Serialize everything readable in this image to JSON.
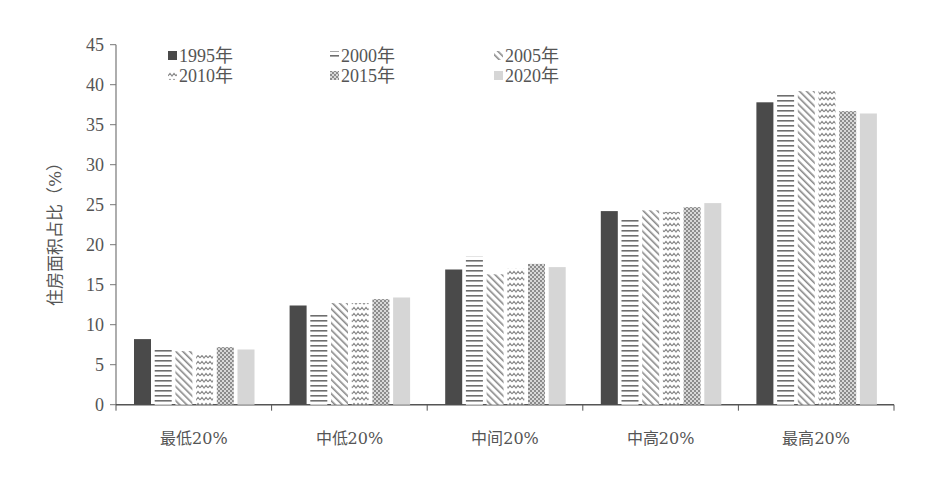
{
  "chart_data": {
    "type": "bar",
    "title": "",
    "xlabel": "",
    "ylabel": "住房面积占比（%）",
    "ylim": [
      0,
      45
    ],
    "yticks": [
      0,
      5,
      10,
      15,
      20,
      25,
      30,
      35,
      40,
      45
    ],
    "grid": false,
    "legend_position": "top-left, inside plot, 3 columns",
    "categories": [
      "最低20%",
      "中低20%",
      "中间20%",
      "中高20%",
      "最高20%"
    ],
    "series": [
      {
        "name": "1995年",
        "pattern": "solid-dark",
        "color": "#4a4a4a",
        "values": [
          8.2,
          12.4,
          16.9,
          24.2,
          37.8
        ]
      },
      {
        "name": "2000年",
        "pattern": "horizontal-lines",
        "color": "#777777",
        "values": [
          7.1,
          11.4,
          18.5,
          23.4,
          38.8
        ]
      },
      {
        "name": "2005年",
        "pattern": "diagonal-lines",
        "color": "#8a8a8a",
        "values": [
          6.7,
          12.7,
          16.3,
          24.3,
          39.2
        ]
      },
      {
        "name": "2010年",
        "pattern": "zigzag",
        "color": "#8a8a8a",
        "values": [
          6.2,
          12.7,
          17.0,
          24.1,
          39.2
        ]
      },
      {
        "name": "2015年",
        "pattern": "checker-dots",
        "color": "#8a8a8a",
        "values": [
          7.2,
          13.2,
          17.6,
          24.7,
          36.7
        ]
      },
      {
        "name": "2020年",
        "pattern": "solid-light",
        "color": "#d4d4d4",
        "values": [
          6.9,
          13.4,
          17.2,
          25.2,
          36.4
        ]
      }
    ]
  }
}
